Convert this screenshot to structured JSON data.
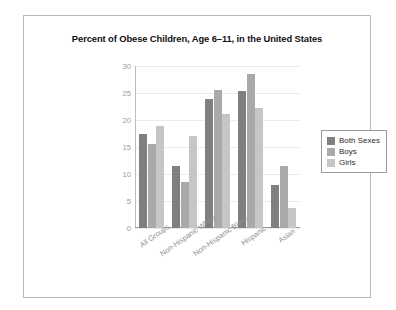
{
  "frame": {
    "border_color": "#b9b9b9",
    "background": "#ffffff"
  },
  "chart_data": {
    "type": "bar",
    "title": "Percent of Obese Children, Age 6–11, in the United States",
    "xlabel": "",
    "ylabel": "",
    "ylim": [
      0,
      30
    ],
    "yticks": [
      0,
      5,
      10,
      15,
      20,
      25,
      30
    ],
    "ytick_labels": [
      "0",
      "5",
      "10",
      "15",
      "20",
      "25",
      "30"
    ],
    "grid": true,
    "legend_position": "right",
    "categories": [
      "All Groups",
      "Non-Hispanic White",
      "Non-Hispanic Black",
      "Hispanic",
      "Asian"
    ],
    "series": [
      {
        "name": "Both Sexes",
        "color": "#7f7f7f",
        "values": [
          17.4,
          11.5,
          23.8,
          25.3,
          8.0
        ]
      },
      {
        "name": "Boys",
        "color": "#a9a9a9",
        "values": [
          15.5,
          8.6,
          25.6,
          28.6,
          11.5
        ]
      },
      {
        "name": "Girls",
        "color": "#c6c6c6",
        "values": [
          18.9,
          17.0,
          21.2,
          22.2,
          3.7
        ]
      }
    ]
  }
}
